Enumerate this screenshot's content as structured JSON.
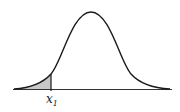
{
  "diagram": {
    "type": "normal-distribution-curve",
    "shaded_region": "left tail below x1",
    "marker_label": "x",
    "marker_subscript": "1",
    "colors": {
      "curve": "#1a1a1a",
      "axis": "#333333",
      "shade": "#c8c8c8",
      "background": "#ffffff"
    }
  }
}
